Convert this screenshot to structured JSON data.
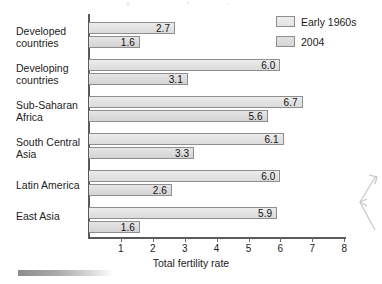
{
  "chart_data": {
    "type": "bar",
    "orientation": "horizontal",
    "title": "",
    "xlabel": "Total fertility rate",
    "ylabel": "",
    "xlim": [
      0,
      8.4
    ],
    "xticks": [
      1,
      2,
      3,
      4,
      5,
      6,
      7,
      8
    ],
    "grid": false,
    "legend_position": "top-right",
    "categories": [
      "Developed\ncountries",
      "Developing\ncountries",
      "Sub-Saharan\nAfrica",
      "South Central\nAsia",
      "Latin America",
      "East Asia"
    ],
    "series": [
      {
        "name": "Early 1960s",
        "values": [
          2.7,
          6.0,
          6.7,
          6.1,
          6.0,
          5.9
        ],
        "labels": [
          "2.7",
          "6.0",
          "6.7",
          "6.1",
          "6.0",
          "5.9"
        ],
        "color": "#e3e3e3"
      },
      {
        "name": "2004",
        "values": [
          1.6,
          3.1,
          5.6,
          3.3,
          2.6,
          1.6
        ],
        "labels": [
          "1.6",
          "3.1",
          "5.6",
          "3.3",
          "2.6",
          "1.6"
        ],
        "color": "#d8d8d8"
      }
    ]
  },
  "axis": {
    "tick_labels": [
      "1",
      "2",
      "3",
      "4",
      "5",
      "6",
      "7",
      "8"
    ],
    "title": "Total fertility rate"
  },
  "legend": {
    "items": [
      {
        "label": "Early 1960s"
      },
      {
        "label": "2004"
      }
    ]
  },
  "colors": {
    "axis_line": "#5a5a5a",
    "bar_border": "#8e8e8e",
    "bar_fill_early": "#e3e3e3",
    "bar_fill_2004": "#d8d8d8",
    "text": "#1c1c1c",
    "page_background": "#ffffff"
  }
}
